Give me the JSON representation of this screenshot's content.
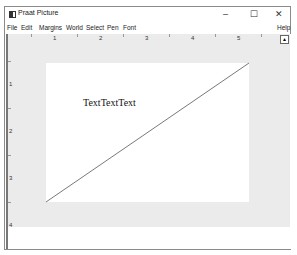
{
  "window": {
    "title": "Praat Picture",
    "controls": {
      "minimize": "–",
      "maximize": "☐",
      "close": "✕"
    }
  },
  "menubar": {
    "items": [
      "File",
      "Edit",
      "Margins",
      "World",
      "Select",
      "Pen",
      "Font"
    ],
    "help": "Help"
  },
  "rulers": {
    "horizontal": [
      "1",
      "2",
      "3",
      "4",
      "5"
    ],
    "vertical": [
      "1",
      "2",
      "3",
      "4"
    ]
  },
  "drawing": {
    "text": "TextTextText",
    "line": {
      "x1": 44,
      "y1": 201,
      "x2": 246,
      "y2": 62
    }
  },
  "colors": {
    "gray_area": "#ebebeb",
    "paper": "#ffffff",
    "line": "#555555"
  }
}
